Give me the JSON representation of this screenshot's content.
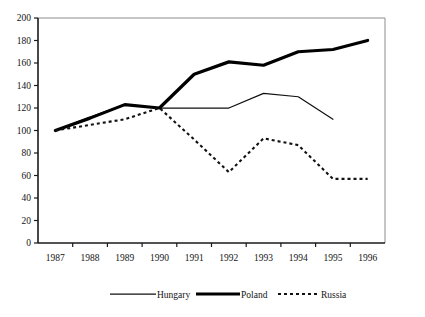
{
  "chart_data": {
    "type": "line",
    "title": "",
    "subtitle": "",
    "xlabel": "",
    "ylabel": "",
    "categories": [
      "1987",
      "1988",
      "1989",
      "1990",
      "1991",
      "1992",
      "1993",
      "1994",
      "1995",
      "1996"
    ],
    "ylim": [
      0,
      200
    ],
    "yticks": [
      0,
      20,
      40,
      60,
      80,
      100,
      120,
      140,
      160,
      180,
      200
    ],
    "ytick_labels": [
      "0",
      "20",
      "40",
      "60",
      "80",
      "100",
      "120",
      "140",
      "160",
      "180",
      "200"
    ],
    "grid": false,
    "legend_position": "bottom",
    "series": [
      {
        "name": "Hungary",
        "style": "thin-solid",
        "color": "#111111",
        "values": [
          100,
          112,
          123,
          120,
          120,
          120,
          133,
          130,
          110,
          null
        ]
      },
      {
        "name": "Poland",
        "style": "thick-solid",
        "color": "#000000",
        "values": [
          100,
          111,
          123,
          120,
          150,
          161,
          158,
          170,
          172,
          180
        ]
      },
      {
        "name": "Russia",
        "style": "dashed",
        "color": "#111111",
        "values": [
          100,
          105,
          110,
          120,
          92,
          63,
          93,
          87,
          57,
          57
        ]
      }
    ]
  },
  "legend": {
    "items": [
      {
        "label": "Hungary"
      },
      {
        "label": "Poland"
      },
      {
        "label": "Russia"
      }
    ]
  },
  "axes": {
    "y_axis_name": "value-axis",
    "x_axis_name": "year-axis"
  }
}
